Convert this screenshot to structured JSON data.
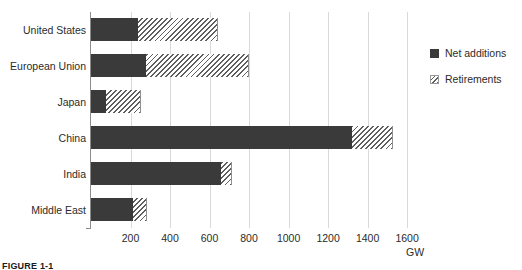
{
  "chart_data": {
    "type": "bar",
    "orientation": "horizontal",
    "stacked": true,
    "title": "",
    "subtitle": "",
    "xlabel": "GW",
    "ylabel": "",
    "categories": [
      "United States",
      "European Union",
      "Japan",
      "China",
      "India",
      "Middle East"
    ],
    "series": [
      {
        "name": "Net additions",
        "values": [
          238,
          278,
          76,
          1320,
          658,
          213
        ],
        "color": "#3a3a3a",
        "pattern": "solid"
      },
      {
        "name": "Retirements",
        "values": [
          405,
          522,
          177,
          210,
          57,
          72
        ],
        "color": "#5e5e5e",
        "pattern": "diagonal-hatch"
      }
    ],
    "totals": [
      643,
      800,
      253,
      1530,
      715,
      285
    ],
    "xlim": [
      0,
      1645
    ],
    "xticks": [
      200,
      400,
      600,
      800,
      1000,
      1200,
      1400,
      1600
    ],
    "xtick_labels": [
      "200",
      "400",
      "600",
      "800",
      "1000",
      "1200",
      "1400",
      "1600"
    ],
    "grid": "vertical",
    "legend_position": "right"
  },
  "axis": {
    "unit_label": "GW"
  },
  "legend": {
    "items": [
      {
        "label": "Net additions"
      },
      {
        "label": "Retirements"
      }
    ]
  },
  "caption": {
    "text": "FIGURE 1-1"
  }
}
